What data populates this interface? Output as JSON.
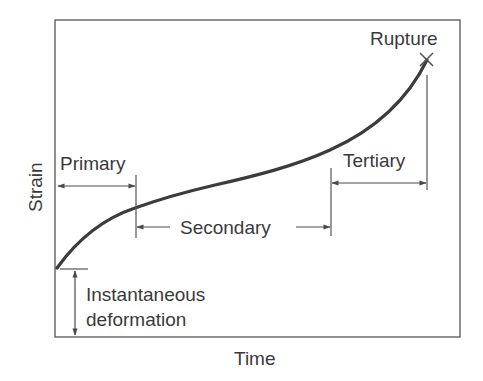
{
  "diagram": {
    "axes": {
      "x_label": "Time",
      "y_label": "Strain"
    },
    "stages": [
      {
        "id": "primary",
        "label": "Primary"
      },
      {
        "id": "secondary",
        "label": "Secondary"
      },
      {
        "id": "tertiary",
        "label": "Tertiary"
      }
    ],
    "annotations": {
      "rupture": "Rupture",
      "instantaneous_line1": "Instantaneous",
      "instantaneous_line2": "deformation"
    },
    "colors": {
      "curve": "#3c3c3c",
      "lines": "#4a4a4a",
      "text": "#3a3a3a",
      "background": "#ffffff"
    }
  }
}
